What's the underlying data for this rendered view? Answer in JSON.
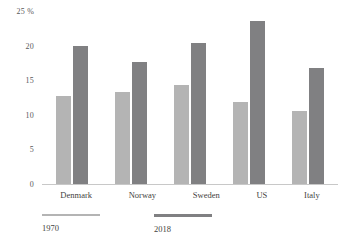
{
  "chart_data": {
    "type": "bar",
    "title": "",
    "subtitle": "",
    "xlabel": "",
    "ylabel": "%",
    "categories": [
      "Denmark",
      "Norway",
      "Sweden",
      "US",
      "Italy"
    ],
    "series": [
      {
        "name": "1970",
        "color": "#b4b4b4",
        "values": [
          12.7,
          13.3,
          14.3,
          11.8,
          10.6
        ]
      },
      {
        "name": "2018",
        "color": "#808082",
        "values": [
          20.0,
          17.6,
          20.4,
          23.6,
          16.7
        ]
      }
    ],
    "ylim": [
      0,
      25
    ],
    "ytick_values": [
      25,
      20,
      15,
      10,
      5,
      0
    ],
    "ytick_labels": [
      "25 %",
      "20",
      "15",
      "10",
      "5",
      "0"
    ],
    "grid": false,
    "legend_position": "bottom-left",
    "axis_line_color": "#c8c8c8"
  },
  "legend": {
    "items": [
      {
        "label": "1970",
        "color": "#b4b4b4"
      },
      {
        "label": "2018",
        "color": "#808082"
      }
    ]
  }
}
